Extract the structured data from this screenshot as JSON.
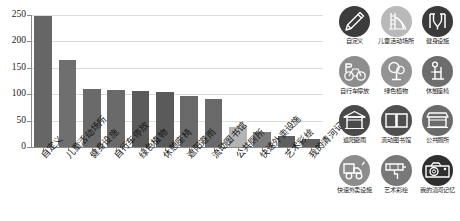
{
  "chart_data": {
    "type": "bar",
    "title": "",
    "subtitle": "",
    "xlabel": "",
    "ylabel": "",
    "ylim": [
      0,
      250
    ],
    "yticks": [
      0,
      50,
      100,
      150,
      200,
      250
    ],
    "grid": true,
    "legend_position": "right",
    "categories": [
      "自定义",
      "儿童活动场所",
      "健身设施",
      "自行车停放",
      "绿色植物",
      "休憩座椅",
      "遮阳避雨",
      "流动图书馆",
      "公共厕所",
      "快速外卖设施",
      "艺术彩绘",
      "我的清河记忆"
    ],
    "values": [
      249,
      165,
      110,
      108,
      106,
      104,
      96,
      90,
      38,
      29,
      21,
      16
    ],
    "bar_colors": [
      "#666666",
      "#6f6f6f",
      "#6a6a6a",
      "#6a6a6a",
      "#5b5b5b",
      "#5a5a5a",
      "#696969",
      "#696969",
      "#b4b4b4",
      "#7d7d7d",
      "#5e5e5e",
      "#606060"
    ]
  },
  "legend": {
    "rows": [
      [
        {
          "label": "自定义",
          "icon": "pencil-icon",
          "color": "#3c3c3c"
        },
        {
          "label": "儿童活动场所",
          "icon": "playground-slide-icon",
          "color": "#b9b9b9"
        },
        {
          "label": "健身设施",
          "icon": "fitness-equipment-icon",
          "color": "#3a3a3a"
        }
      ],
      [
        {
          "label": "自行车停放",
          "icon": "bicycle-parking-icon",
          "color": "#8d8d8d"
        },
        {
          "label": "绿色植物",
          "icon": "tree-plant-icon",
          "color": "#949494"
        },
        {
          "label": "休憩座椅",
          "icon": "seating-bench-icon",
          "color": "#6d6d6d"
        }
      ],
      [
        {
          "label": "遮阳避雨",
          "icon": "shelter-pavilion-icon",
          "color": "#4a4a4a"
        },
        {
          "label": "流动图书馆",
          "icon": "open-book-icon",
          "color": "#4f4f4f"
        },
        {
          "label": "公共厕所",
          "icon": "public-toilet-kiosk-icon",
          "color": "#6b6b6b"
        }
      ],
      [
        {
          "label": "快速外卖设施",
          "icon": "delivery-vehicle-icon",
          "color": "#8c8c8c"
        },
        {
          "label": "艺术彩绘",
          "icon": "paint-roller-icon",
          "color": "#787878"
        },
        {
          "label": "我的清河记忆",
          "icon": "camera-icon",
          "color": "#2f2f2f"
        }
      ]
    ]
  }
}
